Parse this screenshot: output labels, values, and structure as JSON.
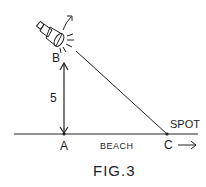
{
  "figure": {
    "caption": "FIG.3",
    "points": {
      "A": "A",
      "B": "B",
      "C": "C"
    },
    "labels": {
      "height": "5",
      "ground": "BEACH",
      "moving_point": "SPOT"
    },
    "icons": {
      "light_source": "spotlight-icon",
      "rotation": "rotation-arrow-icon",
      "motion": "right-arrow-icon"
    },
    "colors": {
      "ink": "#222222",
      "background": "#ffffff"
    }
  }
}
